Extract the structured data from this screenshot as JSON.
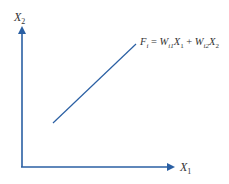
{
  "diagram": {
    "axes": {
      "x_label": "X",
      "x_sub": "1",
      "y_label": "X",
      "y_sub": "2",
      "color": "#2a5fa3"
    },
    "line": {
      "color": "#2a5fa3",
      "from": [
        53,
        123
      ],
      "to": [
        136,
        44
      ]
    },
    "equation": {
      "F": "F",
      "F_sub": "i",
      "eq": " = ",
      "W1": "W",
      "W1_sub": "i1",
      "X1": "X",
      "X1_sub": "1",
      "plus": " + ",
      "W2": "W",
      "W2_sub": "i2",
      "X2": "X",
      "X2_sub": "2"
    }
  }
}
